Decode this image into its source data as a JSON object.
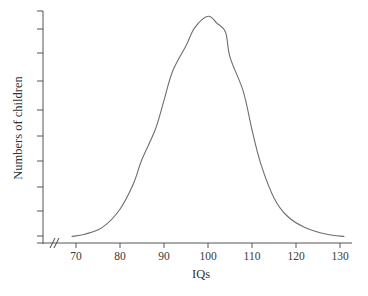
{
  "chart_data": {
    "type": "line",
    "title": "",
    "xlabel": "IQs",
    "ylabel": "Numbers of children",
    "xlim": [
      67,
      132
    ],
    "ylim": [
      0,
      100
    ],
    "x_ticks": [
      70,
      80,
      90,
      100,
      110,
      120,
      130
    ],
    "x_tick_labels": [
      "70",
      "80",
      "90",
      "100",
      "110",
      "120",
      "130"
    ],
    "y_ticks_count": 10,
    "y_tick_labels": [],
    "x_axis_break": true,
    "grid": false,
    "legend": null,
    "series": [
      {
        "name": "Distribution of IQ scores",
        "x": [
          69,
          72,
          76,
          80,
          83,
          85,
          88,
          90,
          92,
          95,
          97,
          100,
          102,
          104,
          105,
          108,
          110,
          112,
          115,
          118,
          122,
          127,
          131
        ],
        "values": [
          2,
          3,
          6,
          14,
          25,
          36,
          49,
          62,
          75,
          86,
          94,
          99,
          96,
          92,
          81,
          66,
          49,
          34,
          19,
          11,
          6,
          3,
          2
        ]
      }
    ],
    "color": "#6e6e6e"
  },
  "axes": {
    "x_label": "IQs",
    "y_label": "Numbers of children",
    "break_symbol": "//"
  }
}
